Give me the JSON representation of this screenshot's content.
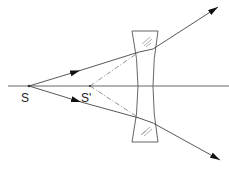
{
  "diagram": {
    "type": "optics-ray-diagram",
    "labels": {
      "source": "S",
      "image": "S'"
    },
    "colors": {
      "line": "#444444",
      "lens": "#555555",
      "background": "#ffffff"
    },
    "elements": {
      "optical_axis": "horizontal line through S and S'",
      "lens": "biconcave lens with hatched glass regions",
      "rays": [
        "upper ray from S refracted outward",
        "lower ray from S refracted outward"
      ],
      "construction_lines": [
        "dash-dot line from S' to upper refraction point",
        "dash-dot line from S' to lower refraction point"
      ]
    }
  }
}
